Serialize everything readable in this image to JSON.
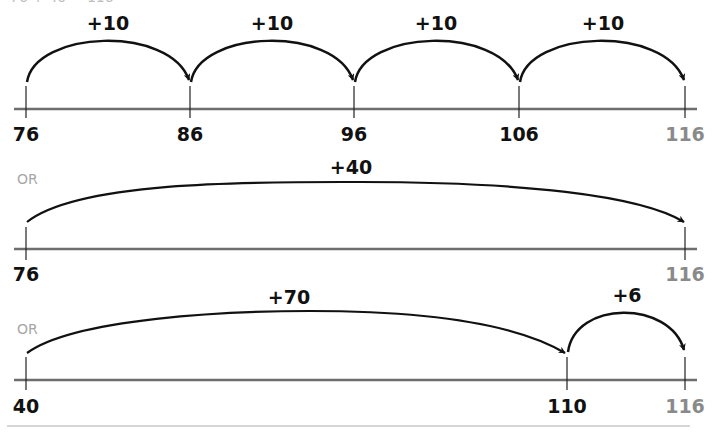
{
  "header": {
    "cut_off_text": "76 + 40 = 116"
  },
  "colors": {
    "line": "#6e6e6e",
    "arc": "#111111",
    "final_label": "#8a8a8a",
    "or_label": "#a6a6a6",
    "rule": "#c8c8c8"
  },
  "number_lines": [
    {
      "ticks": [
        {
          "label": "76",
          "x": 26
        },
        {
          "label": "86",
          "x": 190
        },
        {
          "label": "96",
          "x": 354
        },
        {
          "label": "106",
          "x": 519
        },
        {
          "label": "116",
          "x": 685
        }
      ],
      "jumps": [
        {
          "label": "+10",
          "from": "76",
          "to": "86"
        },
        {
          "label": "+10",
          "from": "86",
          "to": "96"
        },
        {
          "label": "+10",
          "from": "96",
          "to": "106"
        },
        {
          "label": "+10",
          "from": "106",
          "to": "116"
        }
      ]
    },
    {
      "prefix": "OR",
      "ticks": [
        {
          "label": "76",
          "x": 26
        },
        {
          "label": "116",
          "x": 685
        }
      ],
      "jumps": [
        {
          "label": "+40",
          "from": "76",
          "to": "116"
        }
      ]
    },
    {
      "prefix": "OR",
      "ticks": [
        {
          "label": "40",
          "x": 26
        },
        {
          "label": "110",
          "x": 567
        },
        {
          "label": "116",
          "x": 685
        }
      ],
      "jumps": [
        {
          "label": "+70",
          "from": "40",
          "to": "110"
        },
        {
          "label": "+6",
          "from": "110",
          "to": "116"
        }
      ]
    }
  ]
}
